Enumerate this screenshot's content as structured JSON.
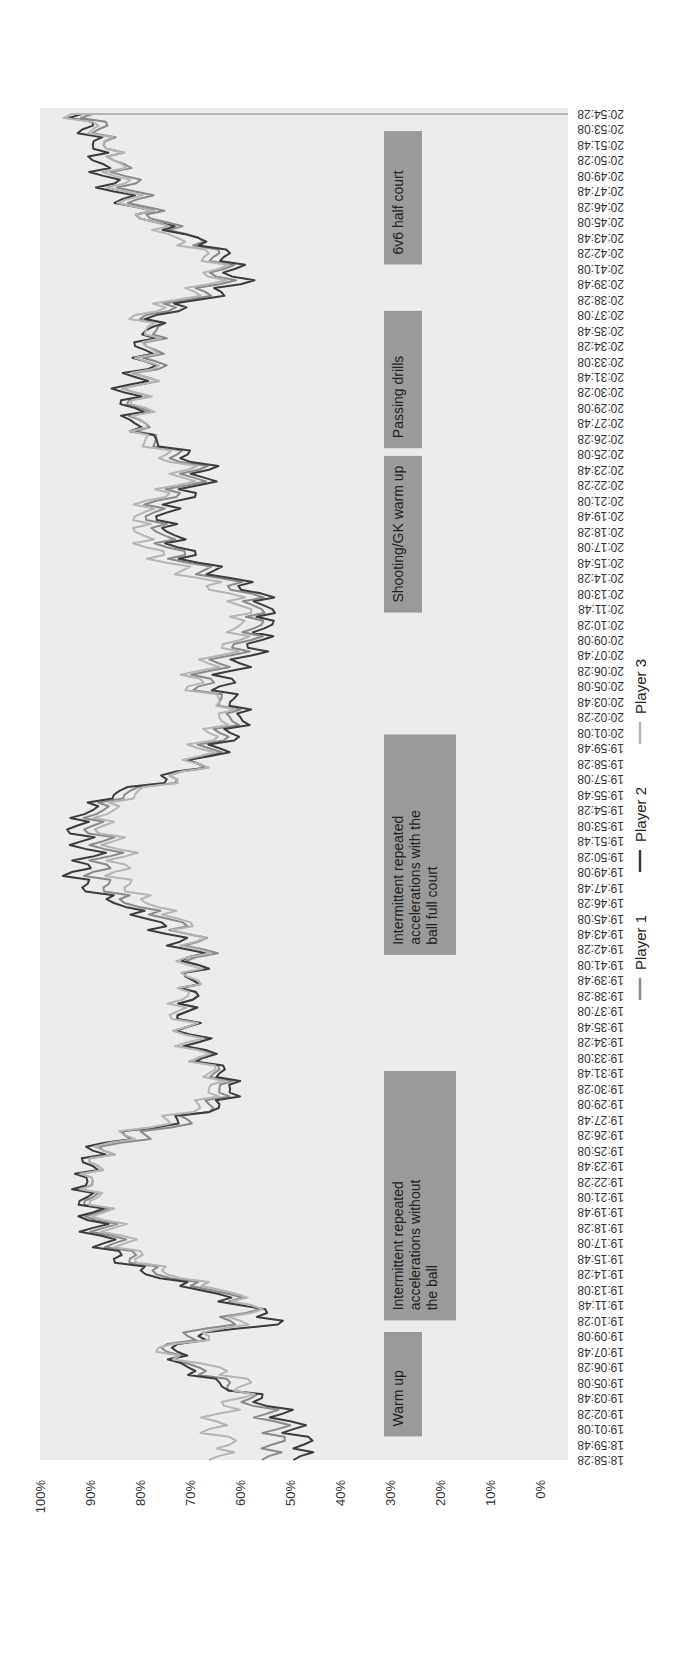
{
  "chart_data": {
    "type": "line",
    "title": "",
    "orientation": "rotated-90-ccw",
    "xlabel": "",
    "ylabel": "",
    "ylim": [
      0,
      100
    ],
    "y_ticks": [
      "0%",
      "10%",
      "20%",
      "30%",
      "40%",
      "50%",
      "60%",
      "70%",
      "80%",
      "90%",
      "100%"
    ],
    "grid": false,
    "legend_position": "bottom",
    "x": [
      "18:58:28",
      "18:59:48",
      "19:01:08",
      "19:02:28",
      "19:03:48",
      "19:05:08",
      "19:06:28",
      "19:07:48",
      "19:09:08",
      "19:10:28",
      "19:11:48",
      "19:13:08",
      "19:14:28",
      "19:15:48",
      "19:17:08",
      "19:18:28",
      "19:19:48",
      "19:21:08",
      "19:22:28",
      "19:23:48",
      "19:25:08",
      "19:26:28",
      "19:27:48",
      "19:29:08",
      "19:30:28",
      "19:31:48",
      "19:33:08",
      "19:34:28",
      "19:35:48",
      "19:37:08",
      "19:38:28",
      "19:39:48",
      "19:41:08",
      "19:42:28",
      "19:43:48",
      "19:45:08",
      "19:46:28",
      "19:47:48",
      "19:49:08",
      "19:50:28",
      "19:51:48",
      "19:53:08",
      "19:54:28",
      "19:55:48",
      "19:57:08",
      "19:58:28",
      "19:59:48",
      "20:01:08",
      "20:02:28",
      "20:03:48",
      "20:05:08",
      "20:06:28",
      "20:07:48",
      "20:09:08",
      "20:10:28",
      "20:11:48",
      "20:13:08",
      "20:14:28",
      "20:15:48",
      "20:17:08",
      "20:18:28",
      "20:19:48",
      "20:21:08",
      "20:22:28",
      "20:23:48",
      "20:25:08",
      "20:26:28",
      "20:27:48",
      "20:29:08",
      "20:30:28",
      "20:31:48",
      "20:33:08",
      "20:34:28",
      "20:35:48",
      "20:37:08",
      "20:38:28",
      "20:39:48",
      "20:41:08",
      "20:42:28",
      "20:43:48",
      "20:45:08",
      "20:46:28",
      "20:47:48",
      "20:49:08",
      "20:50:28",
      "20:51:48",
      "20:53:08",
      "20:54:28"
    ],
    "series": [
      {
        "name": "Player 1",
        "color": "#8a8a8a",
        "values": [
          58,
          56,
          55,
          57,
          60,
          64,
          70,
          76,
          72,
          64,
          60,
          68,
          78,
          83,
          86,
          88,
          89,
          90,
          90,
          89,
          88,
          80,
          72,
          68,
          66,
          67,
          70,
          70,
          72,
          72,
          70,
          71,
          70,
          69,
          72,
          76,
          84,
          88,
          90,
          87,
          88,
          90,
          88,
          84,
          74,
          70,
          68,
          66,
          64,
          66,
          70,
          68,
          64,
          60,
          58,
          58,
          60,
          66,
          72,
          76,
          78,
          80,
          78,
          72,
          70,
          74,
          78,
          80,
          81,
          82,
          80,
          78,
          80,
          78,
          80,
          72,
          66,
          65,
          66,
          70,
          76,
          80,
          82,
          84,
          86,
          88,
          89,
          90
        ]
      },
      {
        "name": "Player 2",
        "color": "#3c3c3c",
        "values": [
          52,
          50,
          52,
          54,
          58,
          66,
          72,
          74,
          70,
          54,
          62,
          70,
          80,
          86,
          88,
          90,
          90,
          91,
          91,
          90,
          90,
          84,
          74,
          66,
          64,
          66,
          69,
          70,
          72,
          72,
          70,
          71,
          70,
          72,
          76,
          80,
          86,
          92,
          94,
          90,
          92,
          93,
          90,
          86,
          76,
          70,
          66,
          64,
          62,
          64,
          66,
          64,
          60,
          58,
          56,
          56,
          58,
          64,
          70,
          74,
          76,
          78,
          74,
          70,
          68,
          72,
          78,
          82,
          82,
          84,
          82,
          80,
          82,
          80,
          78,
          70,
          62,
          63,
          64,
          70,
          78,
          82,
          86,
          88,
          90,
          90,
          92,
          92
        ]
      },
      {
        "name": "Player 3",
        "color": "#b5b5b5",
        "values": [
          68,
          64,
          68,
          66,
          62,
          60,
          66,
          78,
          68,
          62,
          60,
          66,
          76,
          82,
          84,
          86,
          88,
          89,
          90,
          89,
          88,
          84,
          76,
          70,
          68,
          68,
          70,
          72,
          72,
          74,
          72,
          70,
          72,
          70,
          72,
          74,
          80,
          84,
          86,
          84,
          86,
          88,
          86,
          82,
          74,
          70,
          70,
          68,
          66,
          66,
          72,
          70,
          66,
          62,
          62,
          60,
          64,
          70,
          76,
          80,
          82,
          82,
          80,
          74,
          72,
          76,
          80,
          80,
          80,
          82,
          80,
          80,
          80,
          80,
          82,
          74,
          68,
          66,
          68,
          74,
          78,
          82,
          84,
          86,
          86,
          88,
          90,
          94
        ]
      }
    ],
    "annotations": [
      {
        "label": "Warm up",
        "start": "19:00:30",
        "end": "19:09:30"
      },
      {
        "label": "Intermittent repeated accelerations without the ball",
        "start": "19:10:30",
        "end": "19:32:00"
      },
      {
        "label": "Intermittent repeated accelerations with the ball full court",
        "start": "19:42:00",
        "end": "20:01:00"
      },
      {
        "label": "Shooting/GK warm up",
        "start": "20:11:30",
        "end": "20:25:00"
      },
      {
        "label": "Passing drills",
        "start": "20:25:40",
        "end": "20:37:30"
      },
      {
        "label": "6v6 half court",
        "start": "20:41:30",
        "end": "20:53:00"
      }
    ]
  },
  "legend": {
    "items": [
      {
        "label": "Player 1",
        "color": "#8a8a8a"
      },
      {
        "label": "Player 2",
        "color": "#3c3c3c"
      },
      {
        "label": "Player 3",
        "color": "#b5b5b5"
      }
    ]
  },
  "colors": {
    "plot_background": "#ececec",
    "annotation_box": "#9a9a9a",
    "axis_text": "#333333"
  }
}
